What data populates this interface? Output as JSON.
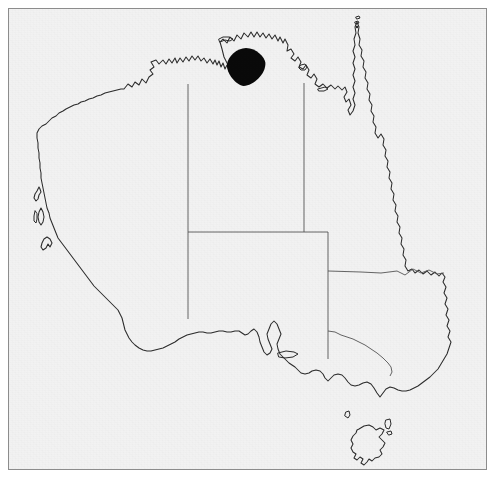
{
  "figure": {
    "type": "distribution-map",
    "caption": "",
    "background_color": "#f2f2f2",
    "page_color": "#ffffff",
    "frame": {
      "color": "#8c8c8c",
      "x": 8,
      "y": 8,
      "width": 479,
      "height": 462,
      "line_width": 1
    }
  },
  "map": {
    "name": "australia-outline-map",
    "coastline_color": "#2b2b2b",
    "state_border_color": "#555555",
    "projection_hint": "equirectangular",
    "landmasses": [
      {
        "name": "mainland-australia"
      },
      {
        "name": "tasmania"
      },
      {
        "name": "king-island"
      },
      {
        "name": "flinders-island"
      },
      {
        "name": "kangaroo-island"
      },
      {
        "name": "groote-eylandt"
      },
      {
        "name": "melville-island"
      },
      {
        "name": "mornington-island"
      },
      {
        "name": "torres-strait-islands"
      },
      {
        "name": "dirk-hartog-island"
      },
      {
        "name": "barrow-island"
      }
    ],
    "state_borders": [
      {
        "name": "wa-nt-sa-border",
        "label": "WA / NT / SA"
      },
      {
        "name": "nt-qld-border",
        "label": "NT / QLD"
      },
      {
        "name": "sa-nt-qld-border",
        "label": "SA northern boundary"
      },
      {
        "name": "qld-nsw-border",
        "label": "QLD / NSW"
      },
      {
        "name": "sa-nsw-vic-border",
        "label": "SA / NSW / VIC"
      },
      {
        "name": "nsw-vic-border",
        "label": "NSW / VIC"
      }
    ]
  },
  "markers": [
    {
      "name": "distribution-blob",
      "shape": "filled-circle",
      "color": "#0a0a0a",
      "center_x": 245,
      "center_y": 66,
      "radius": 19,
      "region": "Northern Territory — Darwin / Top End",
      "label": ""
    }
  ],
  "legend": {
    "present": false,
    "entries": []
  },
  "labels": {
    "present": false,
    "texts": []
  },
  "scale_bar": {
    "present": false
  },
  "north_arrow": {
    "present": false
  }
}
